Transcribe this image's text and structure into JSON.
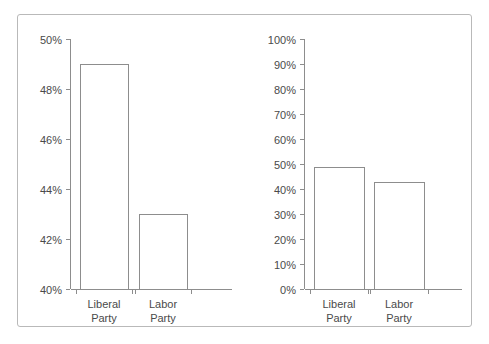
{
  "figure": {
    "background_color": "#ffffff",
    "frame_color": "#b9b9b9",
    "line_color": "#8d8d8d",
    "text_color": "#4a4a4a"
  },
  "chart_data": [
    {
      "type": "bar",
      "name": "truncated-axis-chart",
      "title": "",
      "xlabel": "",
      "ylabel": "",
      "categories": [
        "Liberal Party",
        "Labor Party"
      ],
      "category_lines": [
        [
          "Liberal",
          "Party"
        ],
        [
          "Labor",
          "Party"
        ]
      ],
      "values": [
        49,
        43
      ],
      "value_labels": [
        "49%",
        "43%"
      ],
      "ylim": [
        40,
        50
      ],
      "yticks": [
        40,
        42,
        44,
        46,
        48,
        50
      ],
      "ytick_labels": [
        "40%",
        "42%",
        "44%",
        "46%",
        "48%",
        "50%"
      ],
      "grid": false,
      "legend": false,
      "bar_fill": "#ffffff",
      "bar_stroke": "#8d8d8d"
    },
    {
      "type": "bar",
      "name": "full-axis-chart",
      "title": "",
      "xlabel": "",
      "ylabel": "",
      "categories": [
        "Liberal Party",
        "Labor Party"
      ],
      "category_lines": [
        [
          "Liberal",
          "Party"
        ],
        [
          "Labor",
          "Party"
        ]
      ],
      "values": [
        49,
        43
      ],
      "value_labels": [
        "49%",
        "43%"
      ],
      "ylim": [
        0,
        100
      ],
      "yticks": [
        0,
        10,
        20,
        30,
        40,
        50,
        60,
        70,
        80,
        90,
        100
      ],
      "ytick_labels": [
        "0%",
        "10%",
        "20%",
        "30%",
        "40%",
        "50%",
        "60%",
        "70%",
        "80%",
        "90%",
        "100%"
      ],
      "grid": false,
      "legend": false,
      "bar_fill": "#ffffff",
      "bar_stroke": "#8d8d8d"
    }
  ]
}
